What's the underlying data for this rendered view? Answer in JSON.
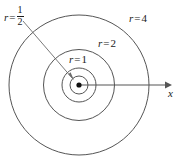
{
  "figure": {
    "kind": "concentric-circles-diagram",
    "background_color": "#ffffff",
    "stroke_color": "#4a4a4a",
    "text_color": "#1a1a1a",
    "center": {
      "x": 79,
      "y": 85
    },
    "axis": {
      "name": "x-axis",
      "label": "x",
      "from_x": 79,
      "to_x": 170,
      "y": 85,
      "arrow": "right"
    },
    "labels": {
      "half": {
        "var": "r",
        "eq": "=",
        "numerator": "1",
        "denominator": "2"
      },
      "one": {
        "var": "r",
        "eq": "=",
        "value": "1"
      },
      "two": {
        "var": "r",
        "eq": "=",
        "value": "2"
      },
      "four": {
        "var": "r",
        "eq": "=",
        "value": "4"
      }
    },
    "circles": [
      {
        "name": "circle-r-half",
        "label": "r = 1/2",
        "r_value": 0.5,
        "pixel_radius": 9
      },
      {
        "name": "circle-r-1",
        "label": "r = 1",
        "r_value": 1,
        "pixel_radius": 17
      },
      {
        "name": "circle-r-2",
        "label": "r = 2",
        "r_value": 2,
        "pixel_radius": 35.5
      },
      {
        "name": "circle-r-4",
        "label": "r = 4",
        "r_value": 4,
        "pixel_radius": 70
      }
    ],
    "leader_line": {
      "name": "leader-line-r-half",
      "from": {
        "x": 23,
        "y": 21
      },
      "to": {
        "x": 73,
        "y": 79
      }
    },
    "center_dot": {
      "radius": 2.6
    }
  }
}
